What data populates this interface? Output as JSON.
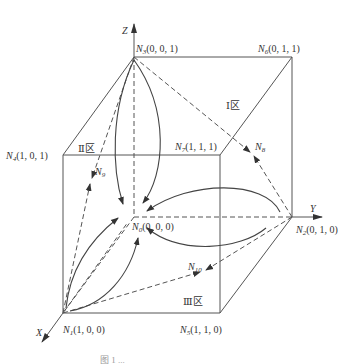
{
  "diagram": {
    "axes": {
      "x": "X",
      "y": "Y",
      "z": "Z"
    },
    "nodes": [
      {
        "id": "N0",
        "sub": "0",
        "coords": "(0, 0, 0)"
      },
      {
        "id": "N1",
        "sub": "1",
        "coords": "(1, 0, 0)"
      },
      {
        "id": "N2",
        "sub": "2",
        "coords": "(0, 1, 0)"
      },
      {
        "id": "N3",
        "sub": "3",
        "coords": "(0, 0, 1)"
      },
      {
        "id": "N4",
        "sub": "4",
        "coords": "(1, 0, 1)"
      },
      {
        "id": "N5",
        "sub": "5",
        "coords": "(1, 1, 0)"
      },
      {
        "id": "N6",
        "sub": "6",
        "coords": "(0, 1, 1)"
      },
      {
        "id": "N7",
        "sub": "7",
        "coords": "(1, 1, 1)"
      },
      {
        "id": "N8",
        "sub": "8",
        "coords": ""
      },
      {
        "id": "N9",
        "sub": "9",
        "coords": ""
      },
      {
        "id": "N10",
        "sub": "10",
        "coords": ""
      }
    ],
    "node_prefix": "N",
    "zones": [
      {
        "id": "zone-1",
        "label": "Ⅰ区"
      },
      {
        "id": "zone-2",
        "label": "Ⅱ区"
      },
      {
        "id": "zone-3",
        "label": "Ⅲ区"
      }
    ],
    "caption": "图 1 ..."
  }
}
